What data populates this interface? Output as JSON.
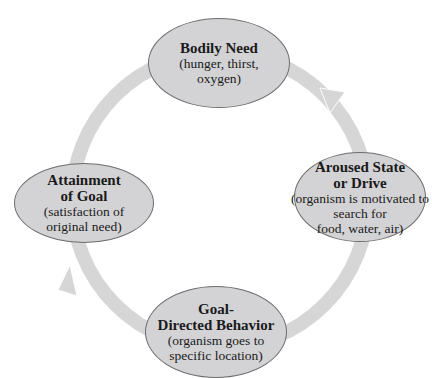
{
  "diagram": {
    "type": "cycle",
    "ring_color": "#d6d6d6",
    "node_fill": "#d3d3d5",
    "nodes": [
      {
        "id": "bodily-need",
        "title": "Bodily Need",
        "desc": [
          "(hunger, thirst,",
          "oxygen)"
        ]
      },
      {
        "id": "aroused-state",
        "title": "Aroused State or Drive",
        "title_lines": [
          "Aroused State",
          "or Drive"
        ],
        "desc": [
          "(organism is motivated to",
          "search for",
          "food, water, air)"
        ]
      },
      {
        "id": "goal-directed",
        "title": "Goal-Directed Behavior",
        "title_lines": [
          "Goal-",
          "Directed Behavior"
        ],
        "desc": [
          "(organism goes to",
          "specific location)"
        ]
      },
      {
        "id": "attainment",
        "title": "Attainment of Goal",
        "title_lines": [
          "Attainment",
          "of Goal"
        ],
        "desc": [
          "(satisfaction of",
          "original need)"
        ]
      }
    ],
    "edges": [
      {
        "from": "bodily-need",
        "to": "aroused-state",
        "arrow": true
      },
      {
        "from": "aroused-state",
        "to": "goal-directed",
        "arrow": false
      },
      {
        "from": "goal-directed",
        "to": "attainment",
        "arrow": true
      },
      {
        "from": "attainment",
        "to": "bodily-need",
        "arrow": false
      }
    ]
  }
}
